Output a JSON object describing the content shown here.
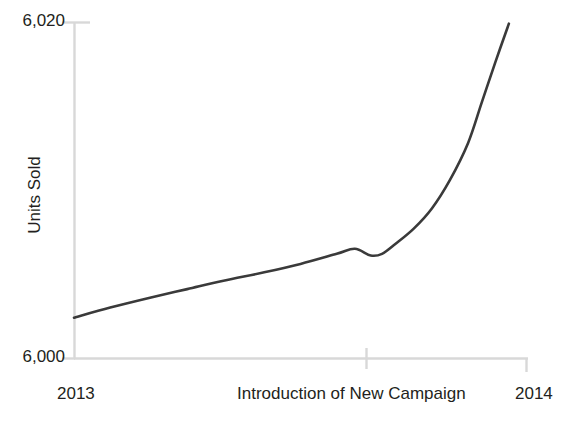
{
  "chart_data": {
    "type": "line",
    "title": "",
    "subtitle": "",
    "xlabel": "",
    "ylabel": "Units Sold",
    "ylim": [
      6000,
      6020
    ],
    "xlim": [
      2013,
      2014
    ],
    "grid": false,
    "legend": null,
    "y_ticks": [
      "6,000",
      "6,020"
    ],
    "y_tick_values": [
      6000,
      6020
    ],
    "x_ticks": [
      "2013",
      "Introduction of New Campaign",
      "2014"
    ],
    "x_tick_values": [
      2013,
      2013.64,
      2014
    ],
    "annotations": [
      "Introduction of New Campaign"
    ],
    "series": [
      {
        "name": "Units Sold",
        "x": [
          2013.0,
          2013.08,
          2013.17,
          2013.25,
          2013.33,
          2013.42,
          2013.5,
          2013.58,
          2013.62,
          2013.655,
          2013.68,
          2013.71,
          2013.75,
          2013.79,
          2013.83,
          2013.87,
          2013.9,
          2013.93,
          2013.96
        ],
        "values": [
          6002.4,
          6003.0,
          6003.6,
          6004.1,
          6004.6,
          6005.1,
          6005.6,
          6006.2,
          6006.5,
          6006.1,
          6006.2,
          6006.8,
          6007.7,
          6008.9,
          6010.6,
          6012.8,
          6015.2,
          6017.6,
          6019.9
        ]
      }
    ],
    "line_color": "#3a3a3a",
    "line_width": 2.6,
    "axis_color": "#d8d8d8",
    "text_color": "#231f20"
  },
  "axis": {
    "y_top_label": "6,020",
    "y_bottom_label": "6,000",
    "y_title": "Units Sold",
    "x_left_label": "2013",
    "x_right_label": "2014",
    "x_center_label": "Introduction of New Campaign"
  }
}
